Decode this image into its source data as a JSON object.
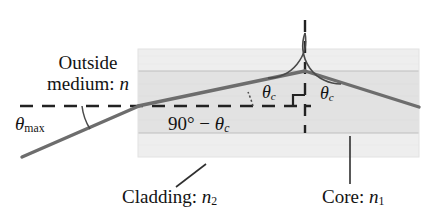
{
  "figure": {
    "type": "optics-ray-diagram"
  },
  "labels": {
    "outside_medium_line1": "Outside",
    "outside_medium_line2_prefix": "medium: ",
    "outside_medium_symbol": "n",
    "theta_max_symbol": "θ",
    "theta_max_sub": "max",
    "ninety_expr_prefix": "90° − ",
    "ninety_expr_symbol": "θ",
    "ninety_expr_sub": "c",
    "theta_c_left_symbol": "θ",
    "theta_c_left_sub": "c",
    "theta_c_right_symbol": "θ",
    "theta_c_right_sub": "c",
    "cladding_prefix": "Cladding: ",
    "cladding_symbol": "n",
    "cladding_sub": "2",
    "core_prefix": "Core: ",
    "core_symbol": "n",
    "core_sub": "1"
  },
  "colors": {
    "background": "#ffffff",
    "ray": "#6b6b6b",
    "ray_dark": "#585858",
    "cladding_fill": "#ececec",
    "core_fill": "#e0e0e0",
    "outer_fill": "#f4f4f4",
    "boundary_line": "#b9b9b9",
    "dashed_line": "#2b2b2b",
    "arc_line": "#4a4a4a",
    "leader_line": "#2f2f2f",
    "text": "#131313"
  },
  "geometry": {
    "fiber_rect": {
      "x": 138,
      "y": 49,
      "width": 281,
      "height": 108
    },
    "core_band": {
      "y_top": 71,
      "y_bottom": 133
    },
    "cladding_band_top": {
      "y_top": 49,
      "y_bottom": 71
    },
    "cladding_band_bottom": {
      "y_top": 133,
      "y_bottom": 157
    },
    "axis_dashed_horizontal": {
      "x1": 20,
      "x2": 311,
      "y": 106
    },
    "normal_dashed_vertical": {
      "x": 305,
      "y1": 20,
      "y2": 133
    },
    "incident_ray": {
      "x1": 22,
      "y1": 156,
      "x2": 138,
      "y2": 106
    },
    "ray_in_core": {
      "x1": 138,
      "y1": 106,
      "x2": 305,
      "y2": 71
    },
    "reflected_ray": {
      "x1": 305,
      "y1": 71,
      "x2": 419,
      "y2": 107
    },
    "theta_max_arc": {
      "cx": 138,
      "cy": 106,
      "radius": 56,
      "start_deg": 180,
      "end_deg": 203
    },
    "theta_c_left_arc": {
      "cx": 305,
      "cy": 71,
      "radius": 38,
      "note": "between ray-in-core and vertical normal"
    },
    "theta_c_right_arc": {
      "cx": 305,
      "cy": 71,
      "radius": 38,
      "note": "between vertical normal and reflected ray"
    },
    "ninety_minus_theta_c_arc": {
      "cx": 138,
      "cy": 106,
      "note": "small dotted arc between dashed axis and ray in core, near x=255"
    },
    "right_angle_marks": [
      {
        "corner_x": 305,
        "corner_y": 106,
        "side": "left",
        "size": 11
      },
      {
        "corner_x": 305,
        "corner_y": 106,
        "side": "right",
        "size": 11
      }
    ],
    "cladding_leader": {
      "x1": 205,
      "y1": 166,
      "x2": 178,
      "y2": 186
    },
    "core_leader": {
      "x1": 350,
      "y1": 137,
      "x2": 350,
      "y2": 183
    }
  },
  "physics_annotations": {
    "acceptance_angle": "θmax is the maximum external incidence angle accepted by the fiber",
    "critical_angle": "θc is the critical angle at the core–cladding interface",
    "internal_angle_relation": "90° − θc is the refracted ray angle measured from the fiber axis",
    "indices": [
      "n (outside medium)",
      "n1 (core)",
      "n2 (cladding)"
    ]
  }
}
